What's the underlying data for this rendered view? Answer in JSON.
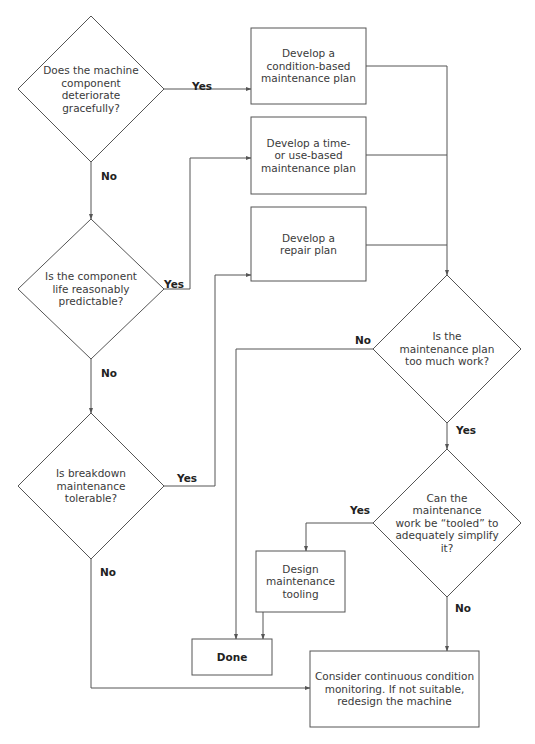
{
  "diagram": {
    "type": "flowchart",
    "nodes": [
      {
        "id": "q_deteriorate",
        "kind": "decision",
        "text": "Does the machine\ncomponent deteriorate\ngracefully?",
        "cx": 91,
        "cy": 89,
        "hw": 73,
        "hh": 73
      },
      {
        "id": "q_predictable",
        "kind": "decision",
        "text": "Is the component\nlife reasonably\npredictable?",
        "cx": 91,
        "cy": 289,
        "hw": 73,
        "hh": 70
      },
      {
        "id": "q_breakdown",
        "kind": "decision",
        "text": "Is breakdown\nmaintenance\ntolerable?",
        "cx": 91,
        "cy": 486,
        "hw": 73,
        "hh": 73
      },
      {
        "id": "p_condition",
        "kind": "process",
        "text": "Develop a\ncondition-based\nmaintenance plan",
        "x": 251,
        "y": 28,
        "w": 115,
        "h": 76
      },
      {
        "id": "p_time",
        "kind": "process",
        "text": "Develop a time-\nor use-based\nmaintenance plan",
        "x": 251,
        "y": 117,
        "w": 115,
        "h": 77
      },
      {
        "id": "p_repair",
        "kind": "process",
        "text": "Develop a\nrepair plan",
        "x": 251,
        "y": 207,
        "w": 115,
        "h": 74
      },
      {
        "id": "q_too_much",
        "kind": "decision",
        "text": "Is the\nmaintenance plan\ntoo much work?",
        "cx": 447,
        "cy": 349,
        "hw": 74,
        "hh": 74
      },
      {
        "id": "q_tooled",
        "kind": "decision",
        "text": "Can the maintenance\nwork be “tooled” to\nadequately simplify it?",
        "cx": 447,
        "cy": 523,
        "hw": 74,
        "hh": 74
      },
      {
        "id": "p_tooling",
        "kind": "process",
        "text": "Design\nmaintenance\ntooling",
        "x": 256,
        "y": 551,
        "w": 89,
        "h": 61
      },
      {
        "id": "t_done",
        "kind": "terminal",
        "text": "Done",
        "x": 192,
        "y": 639,
        "w": 80,
        "h": 36
      },
      {
        "id": "p_monitoring",
        "kind": "process",
        "text": "Consider continuous condition\nmonitoring. If not suitable,\nredesign the machine",
        "x": 310,
        "y": 651,
        "w": 169,
        "h": 76
      }
    ],
    "edges": [
      {
        "from": "q_deteriorate",
        "to": "p_condition",
        "label": "Yes",
        "points": [
          [
            164,
            89
          ],
          [
            251,
            89
          ]
        ],
        "label_pos": [
          192,
          80
        ]
      },
      {
        "from": "q_deteriorate",
        "to": "q_predictable",
        "label": "No",
        "points": [
          [
            91,
            162
          ],
          [
            91,
            219
          ]
        ],
        "label_pos": [
          101,
          170
        ]
      },
      {
        "from": "q_predictable",
        "to": "p_time",
        "label": "Yes",
        "points": [
          [
            164,
            289
          ],
          [
            190,
            289
          ],
          [
            190,
            158
          ],
          [
            251,
            158
          ]
        ],
        "label_pos": [
          164,
          278
        ]
      },
      {
        "from": "q_predictable",
        "to": "q_breakdown",
        "label": "No",
        "points": [
          [
            91,
            359
          ],
          [
            91,
            413
          ]
        ],
        "label_pos": [
          101,
          367
        ]
      },
      {
        "from": "q_breakdown",
        "to": "p_repair",
        "label": "Yes",
        "points": [
          [
            164,
            486
          ],
          [
            215,
            486
          ],
          [
            215,
            275
          ],
          [
            251,
            275
          ]
        ],
        "label_pos": [
          177,
          472
        ]
      },
      {
        "from": "q_breakdown",
        "to": "p_monitoring",
        "label": "No",
        "points": [
          [
            91,
            559
          ],
          [
            91,
            688
          ],
          [
            310,
            688
          ]
        ],
        "label_pos": [
          100,
          566
        ]
      },
      {
        "from": "p_condition",
        "to": "q_too_much",
        "label": "",
        "points": [
          [
            366,
            66
          ],
          [
            447,
            66
          ],
          [
            447,
            275
          ]
        ],
        "label_pos": null
      },
      {
        "from": "p_time",
        "to": "q_too_much",
        "label": "",
        "points": [
          [
            366,
            155
          ],
          [
            447,
            155
          ]
        ],
        "label_pos": null
      },
      {
        "from": "p_repair",
        "to": "q_too_much",
        "label": "",
        "points": [
          [
            366,
            245
          ],
          [
            447,
            245
          ]
        ],
        "label_pos": null
      },
      {
        "from": "q_too_much",
        "to": "t_done",
        "label": "No",
        "points": [
          [
            373,
            349
          ],
          [
            236,
            349
          ],
          [
            236,
            639
          ]
        ],
        "label_pos": [
          355,
          334
        ]
      },
      {
        "from": "q_too_much",
        "to": "q_tooled",
        "label": "Yes",
        "points": [
          [
            447,
            423
          ],
          [
            447,
            449
          ]
        ],
        "label_pos": [
          456,
          424
        ]
      },
      {
        "from": "q_tooled",
        "to": "p_tooling",
        "label": "Yes",
        "points": [
          [
            373,
            523
          ],
          [
            306,
            523
          ],
          [
            306,
            551
          ]
        ],
        "label_pos": [
          350,
          504
        ]
      },
      {
        "from": "p_tooling",
        "to": "t_done",
        "label": "",
        "points": [
          [
            263,
            612
          ],
          [
            263,
            639
          ]
        ],
        "label_pos": null
      },
      {
        "from": "q_tooled",
        "to": "p_monitoring",
        "label": "No",
        "points": [
          [
            447,
            597
          ],
          [
            447,
            651
          ]
        ],
        "label_pos": [
          455,
          602
        ]
      }
    ]
  },
  "colors": {
    "background": "#ffffff",
    "stroke": "#555555",
    "text": "#3a3a3a",
    "label": "#222222"
  }
}
